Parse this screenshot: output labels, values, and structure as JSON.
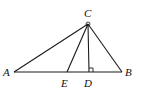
{
  "diagram": {
    "type": "geometry-triangle",
    "colors": {
      "stroke": "#1a1a1a",
      "label": "#111111",
      "background": "#ffffff"
    },
    "points": {
      "A": {
        "label": "A",
        "x": 14,
        "y": 72
      },
      "B": {
        "label": "B",
        "x": 122,
        "y": 72
      },
      "C": {
        "label": "C",
        "x": 88,
        "y": 24
      },
      "D": {
        "label": "D",
        "x": 89,
        "y": 72
      },
      "E": {
        "label": "E",
        "x": 67,
        "y": 72
      }
    },
    "segments": [
      "AB",
      "AC",
      "BC",
      "CE",
      "CD"
    ],
    "markers": {
      "right_angle_at": "D",
      "angle_mark_at": "C"
    }
  }
}
